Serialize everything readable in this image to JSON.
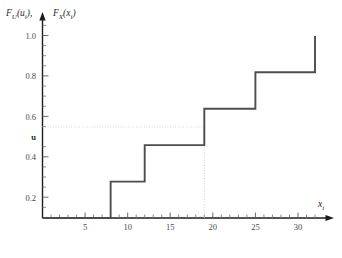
{
  "chart_data": {
    "type": "line",
    "title": "",
    "subtitle": "",
    "ylabel": "F_U(u_i), F_X(x_i)",
    "xlabel": "x_i",
    "xlim": [
      0,
      33.5
    ],
    "ylim": [
      0,
      1.08
    ],
    "grid": false,
    "legend": null,
    "x_ticks_major": [
      5,
      10,
      15,
      20,
      25,
      30
    ],
    "x_tick_labels": [
      "5",
      "10",
      "15",
      "20",
      "25",
      "30"
    ],
    "x_ticks_minor_step": 1,
    "y_ticks": [
      0.2,
      0.4,
      0.6,
      0.8,
      1.0
    ],
    "y_tick_labels": [
      "0.2",
      "0.4",
      "0.6",
      "0.8",
      "1.0"
    ],
    "series": [
      {
        "name": "empirical CDF step function",
        "type": "step",
        "jump_points": [
          {
            "x": 8,
            "y": 0.2
          },
          {
            "x": 12,
            "y": 0.4
          },
          {
            "x": 19,
            "y": 0.6
          },
          {
            "x": 25,
            "y": 0.8
          },
          {
            "x": 32,
            "y": 1.0
          }
        ],
        "start": {
          "x": 0,
          "y": 0.0
        },
        "color": "#4d4d4d"
      }
    ],
    "annotations": [
      {
        "name": "u-level-label",
        "text": "u",
        "axis": "y",
        "value": 0.5,
        "style": "bold"
      },
      {
        "name": "u-horizontal-guide",
        "type": "dotted-horizontal",
        "y": 0.5,
        "x_from": 0,
        "x_to": 19,
        "color": "#c9c9c9"
      },
      {
        "name": "x-vertical-guide",
        "type": "dotted-vertical",
        "x": 19,
        "y_from": 0,
        "y_to": 0.5,
        "color": "#c9c9c9"
      }
    ]
  },
  "labels": {
    "y_axis_main": "F",
    "y_axis_sub_1": "U",
    "y_axis_arg_1": "(u",
    "y_axis_arg_sub_1": "i",
    "y_axis_arg_close_1": ")",
    "y_axis_comma": ",",
    "y_axis_main_2": "F",
    "y_axis_sub_2": "X",
    "y_axis_arg_2": "(x",
    "y_axis_arg_sub_2": "i",
    "y_axis_arg_close_2": ")",
    "x_axis_main": "x",
    "x_axis_sub": "i",
    "u_label": "u",
    "y_1_0": "1.0",
    "y_0_8": "0.8",
    "y_0_6": "0.6",
    "y_0_4": "0.4",
    "y_0_2": "0.2",
    "x_5": "5",
    "x_10": "10",
    "x_15": "15",
    "x_20": "20",
    "x_25": "25",
    "x_30": "30"
  },
  "colors": {
    "curve": "#4d4d4d",
    "axis": "#1c1c1c",
    "guide": "#c9c9c9",
    "tick": "#6e6e6e",
    "text": "#2b2b2b",
    "background": "#ffffff"
  }
}
